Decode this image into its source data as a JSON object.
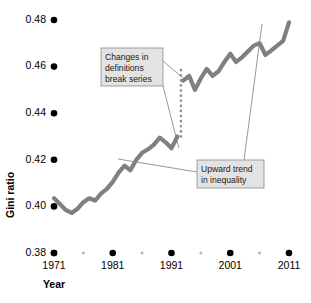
{
  "chart_data": {
    "type": "line",
    "title": "",
    "xlabel": "Year",
    "ylabel": "Gini ratio",
    "xlim": [
      1971,
      2011
    ],
    "ylim": [
      0.38,
      0.48
    ],
    "grid": false,
    "legend": "none",
    "y_ticks": [
      "0.48",
      "0.46",
      "0.44",
      "0.42",
      "0.40",
      "0.38"
    ],
    "y_tick_values": [
      0.48,
      0.46,
      0.44,
      0.42,
      0.4,
      0.38
    ],
    "x_ticks": [
      "1971",
      "1981",
      "1991",
      "2001",
      "2011"
    ],
    "x_tick_values": [
      1971,
      1981,
      1991,
      2001,
      2011
    ],
    "x_minor_tick_values": [
      1976,
      1986,
      1996,
      2006
    ],
    "series": [
      {
        "name": "Gini ratio (old definition)",
        "x": [
          1971,
          1972,
          1973,
          1974,
          1975,
          1976,
          1977,
          1978,
          1979,
          1980,
          1981,
          1982,
          1983,
          1984,
          1985,
          1986,
          1987,
          1988,
          1989,
          1990,
          1991,
          1992
        ],
        "values": [
          0.4035,
          0.401,
          0.3985,
          0.3972,
          0.399,
          0.4018,
          0.4035,
          0.4025,
          0.4055,
          0.4075,
          0.4105,
          0.4145,
          0.4175,
          0.4155,
          0.42,
          0.423,
          0.4245,
          0.4265,
          0.4295,
          0.4275,
          0.425,
          0.43
        ]
      },
      {
        "name": "Gini ratio (new definition)",
        "x": [
          1993,
          1994,
          1995,
          1996,
          1997,
          1998,
          1999,
          2000,
          2001,
          2002,
          2003,
          2004,
          2005,
          2006,
          2007,
          2008,
          2009,
          2010,
          2011
        ],
        "values": [
          0.454,
          0.456,
          0.45,
          0.455,
          0.459,
          0.456,
          0.458,
          0.462,
          0.4655,
          0.462,
          0.464,
          0.4665,
          0.469,
          0.47,
          0.465,
          0.467,
          0.469,
          0.471,
          0.479
        ]
      }
    ],
    "break": {
      "year": 1992.6,
      "from_value": 0.43,
      "to_value": 0.46,
      "style": "dotted"
    },
    "annotations": [
      {
        "id": "break-note",
        "lines": [
          "Changes in",
          "definitions",
          "break series"
        ],
        "text": "Changes in definitions break series"
      },
      {
        "id": "trend-note",
        "lines": [
          "Upward trend",
          "in inequality"
        ],
        "text": "Upward trend in inequality"
      }
    ],
    "colors": {
      "line": "#808080",
      "tick_dot": "#000000",
      "minor_tick_dot": "#b8b8b8",
      "annotation_fill": "#e3e3e3",
      "annotation_border": "#8a8a8a",
      "leader_line": "#6b6b6b",
      "background": "#ffffff"
    }
  }
}
